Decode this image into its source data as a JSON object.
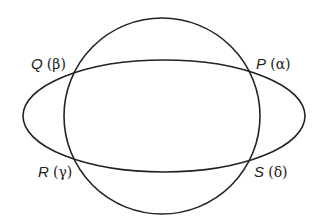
{
  "diagram": {
    "stroke_color": "#222222",
    "background": "#ffffff",
    "circle": {
      "cx": 162,
      "cy": 116,
      "r": 98
    },
    "ellipse": {
      "cx": 164,
      "cy": 116,
      "rx": 141,
      "ry": 56
    },
    "points": [
      {
        "id": "Q",
        "name": "Q",
        "greek": "(β)",
        "x": 73,
        "y": 72
      },
      {
        "id": "P",
        "name": "P",
        "greek": "(α)",
        "x": 253,
        "y": 72
      },
      {
        "id": "R",
        "name": "R",
        "greek": "(γ)",
        "x": 75,
        "y": 160
      },
      {
        "id": "S",
        "name": "S",
        "greek": "(δ)",
        "x": 253,
        "y": 161
      }
    ]
  }
}
